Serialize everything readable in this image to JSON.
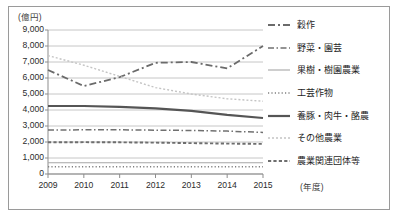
{
  "chart_data": {
    "type": "line",
    "title": "",
    "xlabel": "(年度)",
    "ylabel": "(億円)",
    "x": [
      "2009",
      "2010",
      "2011",
      "2012",
      "2013",
      "2014",
      "2015"
    ],
    "ylim": [
      0,
      9000
    ],
    "ytick_labels": [
      "9,000",
      "8,000",
      "7,000",
      "6,000",
      "5,000",
      "4,000",
      "3,000",
      "2,000",
      "1,000",
      "0"
    ],
    "ytick_values": [
      9000,
      8000,
      7000,
      6000,
      5000,
      4000,
      3000,
      2000,
      1000,
      0
    ],
    "grid": true,
    "legend_position": "right",
    "series": [
      {
        "name": "穀作",
        "style": "dash-dot",
        "color": "#6b6b6b",
        "values": [
          6500,
          5500,
          6050,
          6950,
          7000,
          6600,
          8000
        ]
      },
      {
        "name": "野菜・園芸",
        "style": "dash-dot-medium",
        "color": "#707070",
        "values": [
          2750,
          2760,
          2760,
          2740,
          2720,
          2680,
          2600
        ]
      },
      {
        "name": "果樹・樹園農業",
        "style": "solid-thin",
        "color": "#a6a6a6",
        "values": [
          700,
          700,
          700,
          700,
          700,
          700,
          700
        ]
      },
      {
        "name": "工芸作物",
        "style": "dotted-fine",
        "color": "#808080",
        "values": [
          450,
          450,
          450,
          450,
          450,
          450,
          450
        ]
      },
      {
        "name": "養豚・肉牛・酪農",
        "style": "solid-thick",
        "color": "#555555",
        "values": [
          4250,
          4250,
          4200,
          4100,
          3950,
          3700,
          3500
        ]
      },
      {
        "name": "その他農業",
        "style": "dotted-light",
        "color": "#c4c4c4",
        "values": [
          7400,
          6800,
          6100,
          5400,
          5000,
          4700,
          4550
        ]
      },
      {
        "name": "農業関連団体等",
        "style": "dashed-long",
        "color": "#6e6e6e",
        "values": [
          1980,
          1990,
          1980,
          1960,
          1930,
          1900,
          1880
        ]
      }
    ]
  },
  "legend": {
    "items": [
      {
        "label": "穀作"
      },
      {
        "label": "野菜・園芸"
      },
      {
        "label": "果樹・樹園農業"
      },
      {
        "label": "工芸作物"
      },
      {
        "label": "養豚・肉牛・酪農"
      },
      {
        "label": "その他農業"
      },
      {
        "label": "農業関連団体等"
      }
    ]
  },
  "axes": {
    "y_unit_label": "(億円)",
    "x_unit_label": "(年度)"
  }
}
